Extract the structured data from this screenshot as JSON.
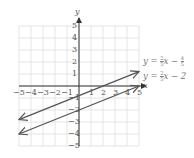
{
  "chart_data": {
    "type": "line",
    "title": "",
    "xlabel": "x",
    "ylabel": "y",
    "xlim": [
      -5,
      5
    ],
    "ylim": [
      -5,
      5
    ],
    "grid": true,
    "x_ticks": [
      "-5",
      "-4",
      "-3",
      "-2",
      "-1",
      "1",
      "2",
      "3",
      "4",
      "5"
    ],
    "y_ticks": [
      "5",
      "4",
      "3",
      "2",
      "1",
      "-1",
      "-2",
      "-3",
      "-4",
      "-5"
    ],
    "series": [
      {
        "name": "y = 2/5 x - 4/5",
        "slope": 0.4,
        "intercept": -0.8,
        "x": [
          -5,
          5
        ],
        "y": [
          -2.8,
          1.2
        ],
        "arrows": "both"
      },
      {
        "name": "y = 2/5 x - 2",
        "slope": 0.4,
        "intercept": -2,
        "x": [
          -5,
          5
        ],
        "y": [
          -4,
          0
        ],
        "arrows": "both"
      }
    ],
    "annotations": [
      {
        "text": "y = 2/5 x − 4/5",
        "position": "right of upper line end"
      },
      {
        "text": "y = 2/5 x − 2",
        "position": "right of lower line end"
      }
    ]
  },
  "labels": {
    "x_axis": "x",
    "y_axis": "y",
    "eq1": {
      "lhs": "y =",
      "num": "2",
      "den": "5",
      "mid": "x −",
      "num2": "4",
      "den2": "5"
    },
    "eq2": {
      "lhs": "y =",
      "num": "2",
      "den": "5",
      "rest": "x − 2"
    }
  }
}
